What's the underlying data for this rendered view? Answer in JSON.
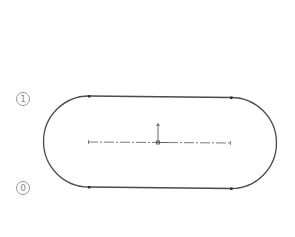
{
  "diagram": {
    "type": "slot-sketch",
    "labels": [
      {
        "text": "1",
        "x": 16,
        "y": 92
      },
      {
        "text": "0",
        "x": 16,
        "y": 181
      }
    ],
    "colors": {
      "outline": "#4a4a4a",
      "centerline": "#6a6a6a",
      "label": "#999999"
    },
    "shape": {
      "top_line": {
        "x1": 89,
        "y1": 96,
        "x2": 231,
        "y2": 97.5
      },
      "bottom_line": {
        "x1": 89,
        "y1": 187,
        "x2": 231,
        "y2": 188.5
      },
      "left_arc_center": {
        "x": 89,
        "y": 141.5
      },
      "right_arc_center": {
        "x": 231,
        "y": 143
      },
      "radius": 45.5
    },
    "centerline": {
      "x1": 88,
      "y1": 142,
      "x2": 231,
      "y2": 143
    },
    "origin": {
      "x": 158,
      "y": 142.5
    }
  }
}
